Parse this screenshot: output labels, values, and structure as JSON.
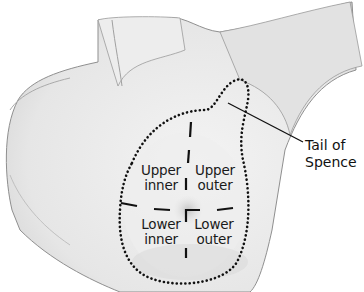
{
  "diagram": {
    "quadrants": [
      {
        "id": "upper-inner",
        "line1": "Upper",
        "line2": "inner"
      },
      {
        "id": "upper-outer",
        "line1": "Upper",
        "line2": "outer"
      },
      {
        "id": "lower-inner",
        "line1": "Lower",
        "line2": "inner"
      },
      {
        "id": "lower-outer",
        "line1": "Lower",
        "line2": "outer"
      }
    ],
    "callout": {
      "line1": "Tail of",
      "line2": "Spence"
    },
    "colors": {
      "skin": "#e9e9e9",
      "shadow": "#9a9a9a",
      "outline": "#111111",
      "background": "#ffffff"
    }
  }
}
